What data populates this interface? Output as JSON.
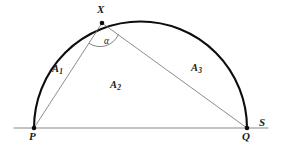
{
  "figure": {
    "kind": "geometry-diagram",
    "background_color": "#ffffff",
    "arc_color": "#0d0d0d",
    "chord_color": "#6e6e6e",
    "baseline_color": "#7a7a7a",
    "point_color": "#0d0d0d",
    "label_color": "#1a1a1a"
  },
  "points": {
    "X": {
      "label": "X",
      "x": 102,
      "y": 23
    },
    "P": {
      "label": "P",
      "x": 34,
      "y": 128
    },
    "Q": {
      "label": "Q",
      "x": 247,
      "y": 128
    },
    "S": {
      "label": "S",
      "x": 268,
      "y": 128
    }
  },
  "angle": {
    "label": "α",
    "vertex": "X",
    "between": "PX and XQ"
  },
  "regions": [
    {
      "key": "A1",
      "label": "A",
      "sub": "1",
      "x": 58,
      "y": 70,
      "meaning": "circular segment between arc PX and chord PX"
    },
    {
      "key": "A2",
      "label": "A",
      "sub": "2",
      "x": 117,
      "y": 86,
      "meaning": "triangle PXQ"
    },
    {
      "key": "A3",
      "label": "A",
      "sub": "3",
      "x": 198,
      "y": 69,
      "meaning": "circular segment between arc XQ and chord XQ"
    }
  ],
  "geometry": {
    "circle_center_x": 140.5,
    "circle_center_y": 128,
    "circle_radius": 106.5,
    "baseline_start_x": 14,
    "baseline_end_x": 268,
    "baseline_y": 128,
    "arc_stroke_width": 2.1,
    "chord_stroke_width": 0.8,
    "baseline_stroke_width": 0.9,
    "point_dot_radius": 2.3,
    "angle_arc_radius": 20
  }
}
